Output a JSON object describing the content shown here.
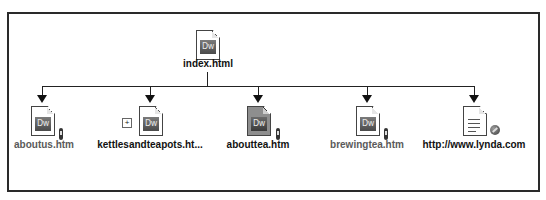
{
  "site_map": {
    "root": {
      "label": "index.html",
      "icon": "dreamweaver-page-icon",
      "icon_text": "Dw"
    },
    "children": [
      {
        "label": "aboutus.htm",
        "icon": "dreamweaver-page-icon",
        "icon_text": "Dw",
        "badge": "checked-out-pen-icon",
        "selected": false,
        "muted": true
      },
      {
        "label": "kettlesandteapots.ht...",
        "icon": "dreamweaver-page-icon",
        "icon_text": "Dw",
        "badge": "expand-plus-icon",
        "selected": false,
        "muted": false
      },
      {
        "label": "abouttea.htm",
        "icon": "dreamweaver-page-icon",
        "icon_text": "Dw",
        "badge": "checked-out-pen-icon",
        "selected": true,
        "muted": false
      },
      {
        "label": "brewingtea.htm",
        "icon": "dreamweaver-page-icon",
        "icon_text": "Dw",
        "badge": "checked-out-pen-icon",
        "selected": false,
        "muted": true
      },
      {
        "label": "http://www.lynda.com",
        "icon": "text-document-icon",
        "badge": "external-link-globe-icon",
        "selected": false,
        "muted": false
      }
    ]
  },
  "colors": {
    "line": "#222222",
    "frame": "#2a2a2a",
    "selected_page": "#8e8e8e",
    "muted_label": "#5a5a5a"
  }
}
